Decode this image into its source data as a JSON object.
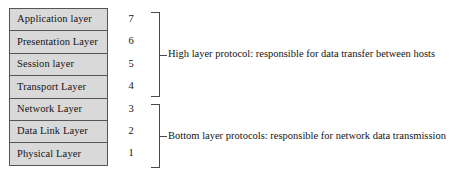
{
  "diagram": {
    "type": "osi-layer-model",
    "layers": [
      {
        "name": "Application layer",
        "number": "7",
        "group": "high"
      },
      {
        "name": "Presentation Layer",
        "number": "6",
        "group": "high"
      },
      {
        "name": "Session layer",
        "number": "5",
        "group": "high"
      },
      {
        "name": "Transport Layer",
        "number": "4",
        "group": "high"
      },
      {
        "name": "Network Layer",
        "number": "3",
        "group": "bottom"
      },
      {
        "name": "Data Link Layer",
        "number": "2",
        "group": "bottom"
      },
      {
        "name": "Physical Layer",
        "number": "1",
        "group": "bottom"
      }
    ],
    "groups": [
      {
        "id": "high",
        "annotation": "High layer protocol: responsible for data transfer between hosts",
        "covers_numbers": [
          "7",
          "6",
          "5",
          "4"
        ]
      },
      {
        "id": "bottom",
        "annotation": "Bottom layer protocols: responsible for network data transmission",
        "covers_numbers": [
          "3",
          "2",
          "1"
        ]
      }
    ],
    "colors": {
      "box_fill": "#d9d9d9",
      "box_border": "#555555",
      "bracket": "#4a4a4a",
      "text": "#141414",
      "background": "#ffffff"
    }
  }
}
